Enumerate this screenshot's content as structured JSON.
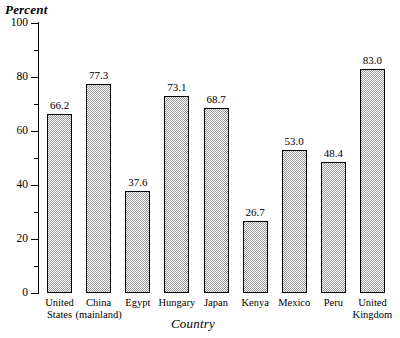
{
  "chart_data": {
    "type": "bar",
    "title": "",
    "xlabel": "Country",
    "ylabel": "Percent",
    "ylim": [
      0,
      100
    ],
    "ytick_step": 20,
    "yminor_step": 10,
    "grid": false,
    "legend": "none",
    "ytick_labels": [
      "0",
      "20",
      "40",
      "60",
      "80",
      "100"
    ],
    "categories": [
      "United States",
      "China (mainland)",
      "Egypt",
      "Hungary",
      "Japan",
      "Kenya",
      "Mexico",
      "Peru",
      "United Kingdom"
    ],
    "category_lines": [
      [
        "United",
        "States"
      ],
      [
        "China",
        "(mainland)"
      ],
      [
        "Egypt"
      ],
      [
        "Hungary"
      ],
      [
        "Japan"
      ],
      [
        "Kenya"
      ],
      [
        "Mexico"
      ],
      [
        "Peru"
      ],
      [
        "United",
        "Kingdom"
      ]
    ],
    "values": [
      66.2,
      77.3,
      37.6,
      73.1,
      68.7,
      26.7,
      53.0,
      48.4,
      83.0
    ],
    "value_labels": [
      "66.2",
      "77.3",
      "37.6",
      "73.1",
      "68.7",
      "26.7",
      "53.0",
      "48.4",
      "83.0"
    ],
    "bar_fill_color": "#d2d2d2",
    "bar_border_color": "#000000",
    "axis_color": "#000000",
    "background_color": "#ffffff"
  }
}
